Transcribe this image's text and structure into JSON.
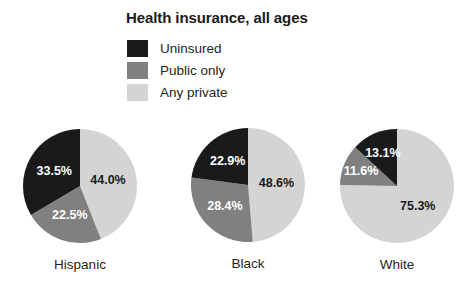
{
  "chart_data": {
    "type": "pie",
    "title": "Health insurance, all ages",
    "xlabel": "",
    "ylabel": "",
    "legend_position": "top-left",
    "grid": false,
    "categories": [
      "Uninsured",
      "Public only",
      "Any private"
    ],
    "colors": {
      "uninsured": "#1a1a1a",
      "public_only": "#808080",
      "any_private": "#d4d4d4",
      "background": "#ffffff",
      "text": "#231f20",
      "label_on_dark": "#ffffff",
      "label_on_light": "#1a1a1a"
    },
    "pies": [
      {
        "name": "Hispanic",
        "slices": [
          {
            "label": "Any private",
            "value": 44.0,
            "text": "44.0%"
          },
          {
            "label": "Public only",
            "value": 22.5,
            "text": "22.5%"
          },
          {
            "label": "Uninsured",
            "value": 33.5,
            "text": "33.5%"
          }
        ]
      },
      {
        "name": "Black",
        "slices": [
          {
            "label": "Any private",
            "value": 48.6,
            "text": "48.6%"
          },
          {
            "label": "Public only",
            "value": 28.4,
            "text": "28.4%"
          },
          {
            "label": "Uninsured",
            "value": 22.9,
            "text": "22.9%"
          }
        ]
      },
      {
        "name": "White",
        "slices": [
          {
            "label": "Any private",
            "value": 75.3,
            "text": "75.3%"
          },
          {
            "label": "Public only",
            "value": 11.6,
            "text": "11.6%"
          },
          {
            "label": "Uninsured",
            "value": 13.1,
            "text": "13.1%"
          }
        ]
      }
    ]
  },
  "title": "Health insurance, all ages",
  "legend": {
    "items": [
      {
        "label": "Uninsured",
        "color": "#1a1a1a"
      },
      {
        "label": "Public only",
        "color": "#808080"
      },
      {
        "label": "Any private",
        "color": "#d4d4d4"
      }
    ]
  },
  "pie_captions": [
    "Hispanic",
    "Black",
    "White"
  ]
}
